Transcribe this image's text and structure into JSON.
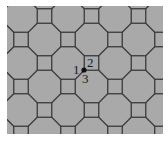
{
  "diagram": {
    "type": "truncated square tiling (4.8.8)",
    "fill_color": "#a9a9a9",
    "edge_color": "#3a3a3a",
    "background": "#ffffff",
    "vertex_labels": [
      "1",
      "2",
      "3"
    ],
    "highlighted_vertex": {
      "x": 84,
      "y": 70
    }
  }
}
